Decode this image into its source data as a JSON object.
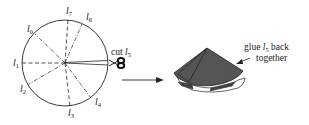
{
  "figure": {
    "left_panel": {
      "description": "circle divided into sectors by 8 radial lines",
      "lines": [
        {
          "label": "l",
          "sub": "0",
          "style": "dash-dot"
        },
        {
          "label": "l",
          "sub": "1",
          "style": "dashed"
        },
        {
          "label": "l",
          "sub": "2",
          "style": "dash-dot"
        },
        {
          "label": "l",
          "sub": "3",
          "style": "dashed"
        },
        {
          "label": "l",
          "sub": "4",
          "style": "dash-dot"
        },
        {
          "label": "l",
          "sub": "5",
          "style": "cut"
        },
        {
          "label": "l",
          "sub": "6",
          "style": "dash-dot"
        },
        {
          "label": "l",
          "sub": "7",
          "style": "dashed"
        }
      ],
      "cut_label": {
        "prefix": "cut ",
        "label": "l",
        "sub": "5"
      },
      "scissors_icon": "scissors"
    },
    "arrow": "right-arrow",
    "right_panel": {
      "description": "folded cone",
      "annotation": {
        "line1_prefix": "glue ",
        "label": "l",
        "sub": "5",
        "line1_suffix": " back",
        "line2": "together"
      }
    }
  }
}
